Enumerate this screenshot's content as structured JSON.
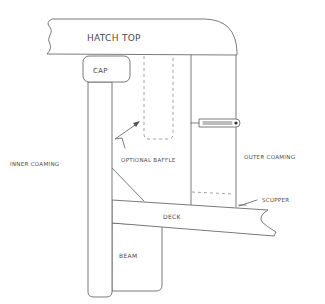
{
  "diagram": {
    "type": "hand-drawn cross-section sketch",
    "colors": {
      "line": "#6b6b6b",
      "dashed": "#8a8a8a",
      "text": "#4a4a4a",
      "background": "#ffffff"
    },
    "labels": {
      "hatch_top": "HATCH TOP",
      "cap": "CAP",
      "inner_coaming": "INNER COAMING",
      "optional_baffle": "OPTIONAL BAFFLE",
      "outer_coaming": "OUTER COAMING",
      "scupper": "SCUPPER",
      "deck": "DECK",
      "beam": "BEAM"
    },
    "parts": [
      "hatch-top",
      "cap",
      "inner-coaming",
      "optional-baffle (dashed)",
      "outer-coaming",
      "latch",
      "corner-block",
      "scupper (dashed)",
      "deck",
      "beam"
    ]
  }
}
